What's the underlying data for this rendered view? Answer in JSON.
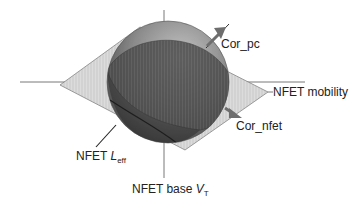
{
  "diagram": {
    "type": "3d-correlation-sphere",
    "axes": {
      "horizontal": "NFET mobility",
      "vertical_bottom": {
        "prefix": "NFET base ",
        "var": "V",
        "sub": "T"
      },
      "diagonal": {
        "prefix": "NFET ",
        "var": "L",
        "sub": "eff"
      }
    },
    "vectors": [
      {
        "label": "Cor_pc",
        "direction": "upper-right"
      },
      {
        "label": "Cor_nfet",
        "direction": "lower-right"
      }
    ],
    "colors": {
      "sphere_light": "#b5b5b5",
      "sphere_dark": "#3a3a3a",
      "plane": "#d9d9d9",
      "arrow": "#707070",
      "axis": "#444444"
    }
  }
}
